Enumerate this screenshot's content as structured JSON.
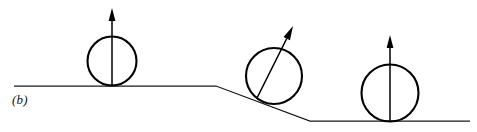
{
  "figure": {
    "panel_label": "(b)",
    "label_position": {
      "x": 12,
      "y": 92
    },
    "width": 477,
    "height": 132,
    "background_color": "#ffffff",
    "line_color": "#1a1a1a",
    "ball_stroke_color": "#000000",
    "vector_color": "#000000"
  },
  "ground": {
    "name": "stepped-ground-profile",
    "points": "14,86 216,86 310,121 470,121",
    "upper_level_y": 86,
    "lower_level_y": 121,
    "upper_start_x": 14,
    "incline_start_x": 216,
    "incline_end_x": 310,
    "lower_end_x": 470,
    "stroke_width": 1.25
  },
  "balls": [
    {
      "id": "ball-left",
      "label": "ball on upper level",
      "cx": 112,
      "cy": 61,
      "r": 24.5,
      "contact_x": 112,
      "contact_y": 86,
      "arrow": {
        "id": "vector-left",
        "orientation": "vertical",
        "angle_deg": 0,
        "tail_x": 112,
        "tail_y": 86,
        "tip_x": 112,
        "tip_y": 8,
        "head_length": 13,
        "head_half_width": 3.4
      }
    },
    {
      "id": "ball-middle",
      "label": "ball on incline",
      "cx": 274,
      "cy": 76,
      "r": 28,
      "contact_x": 257,
      "contact_y": 98,
      "arrow": {
        "id": "vector-middle",
        "orientation": "tilted",
        "angle_deg": 38,
        "tail_x": 257,
        "tail_y": 98,
        "tip_x": 293,
        "tip_y": 26,
        "head_length": 14,
        "head_half_width": 3.6
      }
    },
    {
      "id": "ball-right",
      "label": "ball on lower level",
      "cx": 390,
      "cy": 93,
      "r": 28.5,
      "contact_x": 390,
      "contact_y": 121,
      "arrow": {
        "id": "vector-right",
        "orientation": "vertical",
        "angle_deg": 0,
        "tail_x": 390,
        "tail_y": 121,
        "tip_x": 390,
        "tip_y": 35,
        "head_length": 13,
        "head_half_width": 3.4
      }
    }
  ]
}
